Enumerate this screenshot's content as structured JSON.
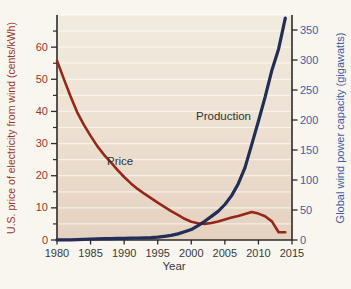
{
  "chart_data": {
    "type": "line",
    "title": "",
    "xlabel": "Year",
    "x": [
      1980,
      1981,
      1982,
      1983,
      1984,
      1985,
      1986,
      1987,
      1988,
      1989,
      1990,
      1991,
      1992,
      1993,
      1994,
      1995,
      1996,
      1997,
      1998,
      1999,
      2000,
      2001,
      2002,
      2003,
      2004,
      2005,
      2006,
      2007,
      2008,
      2009,
      2010,
      2011,
      2012,
      2013,
      2014
    ],
    "xlim": [
      1980,
      2015
    ],
    "x_ticks": [
      1980,
      1985,
      1990,
      1995,
      2000,
      2005,
      2010,
      2015
    ],
    "left_axis": {
      "label": "U.S. price of electricity from wind (cents/kWh)",
      "units": "cents/kWh",
      "ylim": [
        0,
        70
      ],
      "major_ticks": [
        0,
        10,
        20,
        30,
        40,
        50,
        60
      ],
      "minor_ticks": [
        5,
        15,
        25,
        35,
        45,
        55,
        65
      ],
      "label_color": "#97382a"
    },
    "right_axis": {
      "label": "Global wind power capacity (gigawatts)",
      "units": "gigawatts",
      "ylim": [
        0,
        375
      ],
      "major_ticks": [
        0,
        50,
        100,
        150,
        200,
        250,
        300,
        350
      ],
      "label_color": "#3f5da4"
    },
    "grid": {
      "on": true,
      "axis": "left",
      "step": 5,
      "max": 70,
      "color": "rgba(255,255,255,0.6)"
    },
    "series": [
      {
        "name": "Price",
        "axis": "left",
        "color": "#93281a",
        "stroke_width": 2.6,
        "values": [
          55.8,
          50.2,
          44.8,
          39.8,
          35.8,
          32.4,
          29.2,
          26.5,
          24.2,
          21.8,
          19.6,
          17.6,
          15.9,
          14.4,
          13.0,
          11.6,
          10.3,
          9.0,
          7.8,
          6.6,
          5.7,
          5.2,
          5.0,
          5.3,
          5.8,
          6.4,
          7.0,
          7.5,
          8.1,
          8.7,
          8.2,
          7.4,
          5.8,
          2.4,
          2.4
        ]
      },
      {
        "name": "Production",
        "axis": "right",
        "color": "#232e58",
        "stroke_width": 3.2,
        "values": [
          0.1,
          0.1,
          0.2,
          0.6,
          1.1,
          1.7,
          2.0,
          2.2,
          2.4,
          2.6,
          2.8,
          3.0,
          3.3,
          3.6,
          4.0,
          4.8,
          6.1,
          7.6,
          10.2,
          13.6,
          17.4,
          23.9,
          31.1,
          39.4,
          47.6,
          59.1,
          74.0,
          93.9,
          120.7,
          159.0,
          198.0,
          238.1,
          283.0,
          318.5,
          369.9
        ]
      }
    ],
    "annotations": [
      {
        "text": "Price",
        "x": 1989.4,
        "y": 24.7,
        "axis": "left"
      },
      {
        "text": "Production",
        "x": 2004.8,
        "y": 206,
        "axis": "right"
      }
    ],
    "legend_position": "inline-labels",
    "axis_color": "#2b2b2b"
  }
}
